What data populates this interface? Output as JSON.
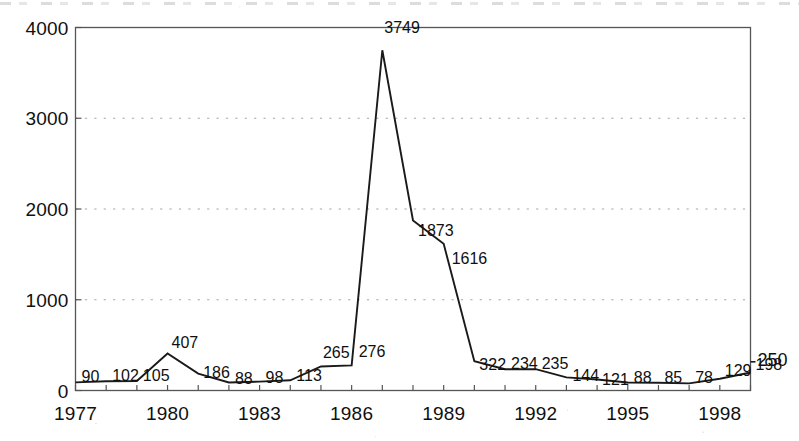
{
  "chart_data": {
    "type": "line",
    "title": "",
    "subtitle": "",
    "xlabel": "",
    "ylabel": "",
    "xlim": [
      1977,
      1999
    ],
    "ylim": [
      0,
      4000
    ],
    "grid": "horizontal-dotted",
    "legend": "none",
    "y_ticks": [
      "0",
      "1000",
      "2000",
      "3000",
      "4000"
    ],
    "y_tick_values": [
      0,
      1000,
      2000,
      3000,
      4000
    ],
    "x_ticks": [
      "1977",
      "1980",
      "1983",
      "1986",
      "1989",
      "1992",
      "1995",
      "1998"
    ],
    "x_tick_values": [
      1977,
      1980,
      1983,
      1986,
      1989,
      1992,
      1995,
      1998
    ],
    "x": [
      1977,
      1978,
      1979,
      1980,
      1981,
      1982,
      1983,
      1984,
      1985,
      1986,
      1987,
      1988,
      1989,
      1990,
      1991,
      1992,
      1993,
      1994,
      1995,
      1996,
      1997,
      1998,
      1999
    ],
    "values": [
      90,
      102,
      105,
      407,
      186,
      88,
      98,
      113,
      265,
      276,
      3749,
      1873,
      1616,
      322,
      234,
      235,
      144,
      121,
      88,
      85,
      78,
      129,
      198
    ],
    "point_labels": [
      "90",
      "102",
      "105",
      "407",
      "186",
      "88",
      "98",
      "113",
      "265",
      "276",
      "3749",
      "1873",
      "1616",
      "322",
      "234",
      "235",
      "144",
      "121",
      "88",
      "85",
      "78",
      "129",
      "198"
    ],
    "trailing_label": "250",
    "line_color": "#1a1a1a",
    "grid_color": "#9aa0b4",
    "axis_color": "#555555",
    "text_color": "#101010"
  }
}
